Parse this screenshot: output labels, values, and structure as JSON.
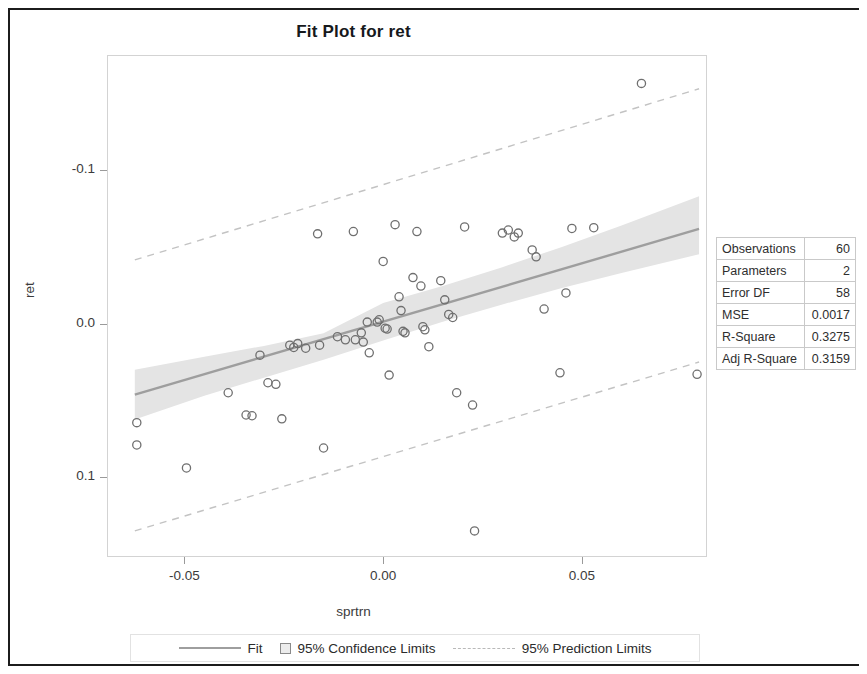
{
  "title": "Fit Plot for ret",
  "axes": {
    "xlabel": "sprtrn",
    "ylabel": "ret",
    "xticks": [
      "-0.05",
      "0.00",
      "0.05"
    ],
    "yticks": [
      "0.1",
      "0.0",
      "-0.1"
    ]
  },
  "stats": {
    "rows": [
      {
        "key": "Observations",
        "value": "60"
      },
      {
        "key": "Parameters",
        "value": "2"
      },
      {
        "key": "Error DF",
        "value": "58"
      },
      {
        "key": "MSE",
        "value": "0.0017"
      },
      {
        "key": "R-Square",
        "value": "0.3275"
      },
      {
        "key": "Adj R-Square",
        "value": "0.3159"
      }
    ]
  },
  "legend": {
    "fit": "Fit",
    "confidence": "95% Confidence Limits",
    "prediction": "95% Prediction Limits"
  },
  "colors": {
    "fit_line": "#9e9e9e",
    "confidence_band": "#e4e4e4",
    "prediction_line": "#c3c3c3",
    "marker": "#6f6f6f",
    "frame": "#d3d3d3",
    "text": "#2e2e2e"
  },
  "chart_data": {
    "type": "scatter",
    "title": "Fit Plot for ret",
    "xlabel": "sprtrn",
    "ylabel": "ret",
    "xlim": [
      -0.0695,
      0.0815
    ],
    "ylim": [
      -0.152,
      0.175
    ],
    "xticks": [
      -0.05,
      0.0,
      0.05
    ],
    "yticks": [
      -0.1,
      0.0,
      0.1
    ],
    "grid": false,
    "legend_position": "bottom",
    "n_observations": 60,
    "r_square": 0.3275,
    "adj_r_square": 0.3159,
    "mse": 0.0017,
    "error_df": 58,
    "parameters": 2,
    "fit_line": {
      "intercept": 0.0013,
      "slope": 0.76,
      "x_start": -0.0625,
      "y_start": -0.0462,
      "x_end": 0.0795,
      "y_end": 0.0617
    },
    "confidence_band": {
      "label": "95% Confidence Limits",
      "x": [
        -0.0625,
        -0.045,
        -0.03,
        -0.015,
        0.0,
        0.015,
        0.03,
        0.045,
        0.06,
        0.0795
      ],
      "lower": [
        -0.0625,
        -0.047,
        -0.0352,
        -0.0235,
        -0.011,
        0.0012,
        0.0125,
        0.0232,
        0.033,
        0.0452
      ],
      "upper": [
        -0.03,
        -0.0215,
        -0.0145,
        -0.0062,
        0.0135,
        0.0245,
        0.0368,
        0.05,
        0.064,
        0.083
      ]
    },
    "prediction_band": {
      "label": "95% Prediction Limits",
      "x": [
        -0.0625,
        0.0795
      ],
      "lower": [
        -0.135,
        -0.025
      ],
      "upper": [
        0.0415,
        0.153
      ]
    },
    "points": [
      {
        "x": -0.062,
        "y": -0.0645
      },
      {
        "x": -0.062,
        "y": -0.079
      },
      {
        "x": -0.0495,
        "y": -0.094
      },
      {
        "x": -0.039,
        "y": -0.045
      },
      {
        "x": -0.0345,
        "y": -0.0595
      },
      {
        "x": -0.033,
        "y": -0.06
      },
      {
        "x": -0.031,
        "y": -0.0205
      },
      {
        "x": -0.029,
        "y": -0.0385
      },
      {
        "x": -0.027,
        "y": -0.0395
      },
      {
        "x": -0.0255,
        "y": -0.062
      },
      {
        "x": -0.0235,
        "y": -0.014
      },
      {
        "x": -0.0225,
        "y": -0.0155
      },
      {
        "x": -0.0215,
        "y": -0.013
      },
      {
        "x": -0.0195,
        "y": -0.016
      },
      {
        "x": -0.0165,
        "y": 0.0585
      },
      {
        "x": -0.016,
        "y": -0.014
      },
      {
        "x": -0.015,
        "y": -0.081
      },
      {
        "x": -0.0115,
        "y": -0.0085
      },
      {
        "x": -0.0095,
        "y": -0.0105
      },
      {
        "x": -0.0075,
        "y": 0.06
      },
      {
        "x": -0.007,
        "y": -0.0105
      },
      {
        "x": -0.0055,
        "y": -0.006
      },
      {
        "x": -0.005,
        "y": -0.012
      },
      {
        "x": -0.004,
        "y": 0.001
      },
      {
        "x": -0.0035,
        "y": -0.019
      },
      {
        "x": -0.0015,
        "y": 0.001
      },
      {
        "x": -0.001,
        "y": 0.0025
      },
      {
        "x": 0.0,
        "y": 0.0405
      },
      {
        "x": 0.0005,
        "y": -0.003
      },
      {
        "x": 0.001,
        "y": -0.0035
      },
      {
        "x": 0.0015,
        "y": -0.0335
      },
      {
        "x": 0.003,
        "y": 0.0645
      },
      {
        "x": 0.004,
        "y": 0.0175
      },
      {
        "x": 0.0045,
        "y": 0.0085
      },
      {
        "x": 0.005,
        "y": -0.005
      },
      {
        "x": 0.0055,
        "y": -0.006
      },
      {
        "x": 0.0075,
        "y": 0.03
      },
      {
        "x": 0.0085,
        "y": 0.06
      },
      {
        "x": 0.0095,
        "y": 0.0245
      },
      {
        "x": 0.01,
        "y": -0.002
      },
      {
        "x": 0.0105,
        "y": -0.004
      },
      {
        "x": 0.0115,
        "y": -0.015
      },
      {
        "x": 0.0145,
        "y": 0.028
      },
      {
        "x": 0.0155,
        "y": 0.0155
      },
      {
        "x": 0.0165,
        "y": 0.006
      },
      {
        "x": 0.0175,
        "y": 0.004
      },
      {
        "x": 0.0185,
        "y": -0.045
      },
      {
        "x": 0.0205,
        "y": 0.063
      },
      {
        "x": 0.0225,
        "y": -0.053
      },
      {
        "x": 0.023,
        "y": -0.135
      },
      {
        "x": 0.03,
        "y": 0.059
      },
      {
        "x": 0.0315,
        "y": 0.061
      },
      {
        "x": 0.033,
        "y": 0.0565
      },
      {
        "x": 0.034,
        "y": 0.059
      },
      {
        "x": 0.0375,
        "y": 0.048
      },
      {
        "x": 0.0385,
        "y": 0.0435
      },
      {
        "x": 0.0405,
        "y": 0.0095
      },
      {
        "x": 0.0445,
        "y": -0.032
      },
      {
        "x": 0.046,
        "y": 0.02
      },
      {
        "x": 0.0475,
        "y": 0.062
      },
      {
        "x": 0.053,
        "y": 0.0625
      },
      {
        "x": 0.065,
        "y": 0.1565
      },
      {
        "x": 0.079,
        "y": -0.033
      }
    ]
  }
}
